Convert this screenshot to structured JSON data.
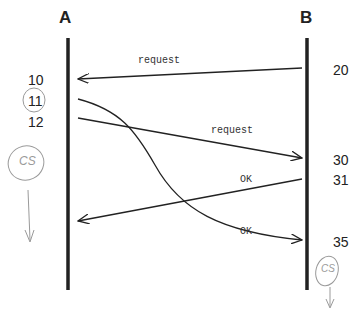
{
  "nodes": {
    "a": {
      "label": "A"
    },
    "b": {
      "label": "B"
    }
  },
  "a_times": [
    "10",
    "11",
    "12"
  ],
  "b_times": [
    "20",
    "30",
    "31",
    "35"
  ],
  "messages": [
    {
      "label": "request",
      "from": "B",
      "to": "A",
      "send_time": "20",
      "recv_time": "10"
    },
    {
      "label": "request",
      "from": "A",
      "to": "B",
      "send_time": "12",
      "recv_time": "30"
    },
    {
      "label": "OK",
      "from": "B",
      "to": "A",
      "send_time": "31"
    },
    {
      "label": "OK",
      "from": "A",
      "to": "B",
      "send_time": "11",
      "recv_time": "35"
    }
  ],
  "annotations": {
    "a_cs": "CS",
    "b_cs": "CS"
  },
  "colors": {
    "line": "#222222",
    "pencil": "#9a9a9a"
  }
}
